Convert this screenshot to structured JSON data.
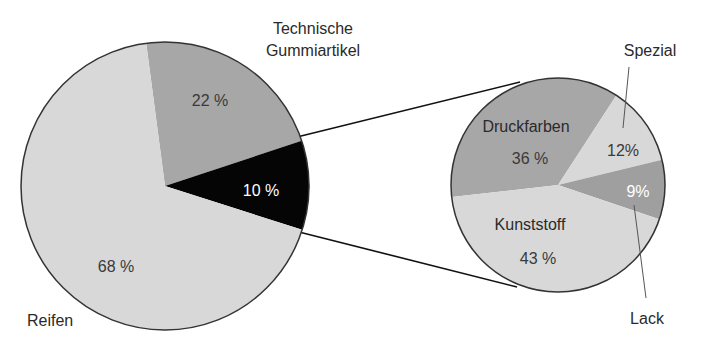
{
  "chart_data": [
    {
      "type": "pie",
      "title": "",
      "categories": [
        "Technische Gummiartikel",
        "Sonstige (Aufschlüsselung)",
        "Reifen"
      ],
      "values": [
        22,
        10,
        68
      ],
      "value_labels": [
        "22 %",
        "10 %",
        "68 %"
      ],
      "colors": [
        "#a7a7a7",
        "#050505",
        "#d8d8d8"
      ],
      "label_colors": [
        "#3a3a3a",
        "#ffffff",
        "#3a3a3a"
      ],
      "outer_labels": {
        "top": [
          "Technische",
          "Gummiartikel"
        ],
        "bottom_left": "Reifen"
      },
      "exploded_slice": "Sonstige (Aufschlüsselung)"
    },
    {
      "type": "pie",
      "title": "",
      "categories": [
        "Druckfarben",
        "Spezial",
        "Lack",
        "Kunststoff"
      ],
      "values": [
        36,
        12,
        9,
        43
      ],
      "value_labels": [
        "36 %",
        "12%",
        "9%",
        "43 %"
      ],
      "colors": [
        "#a7a7a7",
        "#d8d8d8",
        "#9f9f9f",
        "#d8d8d8"
      ],
      "label_colors": [
        "#3a3a3a",
        "#3a3a3a",
        "#ffffff",
        "#3a3a3a"
      ],
      "inner_name_labels": [
        "Druckfarben",
        "",
        "",
        "Kunststoff"
      ],
      "outer_labels": {
        "Spezial": "Spezial",
        "Lack": "Lack"
      },
      "detail_of": "10 %"
    }
  ]
}
